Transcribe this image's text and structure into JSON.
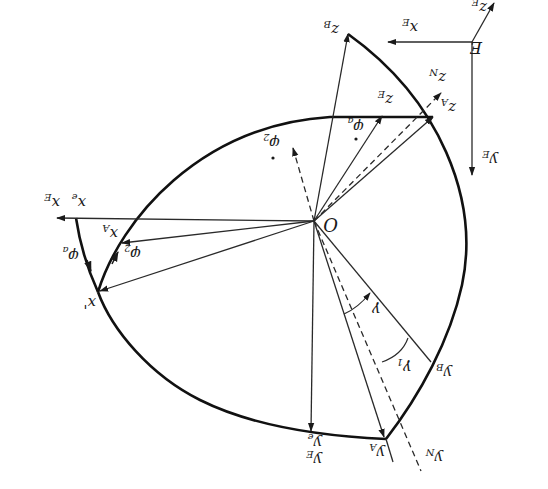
{
  "figure": {
    "orientation": "rotated 180 degrees (upside-down)"
  },
  "colors": {
    "background": "#ffffff",
    "ink": "#1a1a1a"
  },
  "labels": {
    "origin": "O",
    "frame_E": "E",
    "x_E_top": "x",
    "x_E_top_sub": "E",
    "y_E_top": "y",
    "y_E_top_sub": "E",
    "z_E_top": "z",
    "z_E_top_sub": "E",
    "z_B": "z",
    "z_B_sub": "B",
    "z_N": "z",
    "z_N_sub": "N",
    "z_A": "z",
    "z_A_sub": "A",
    "z_E": "z",
    "z_E_sub": "E",
    "phi_a_upper": "φ",
    "phi_a_upper_sub": "a",
    "phi_2_upper": "φ",
    "phi_2_upper_sub": "2",
    "x_E": "x",
    "x_E_sub": "E",
    "x_e": "x",
    "x_e_sub": "e",
    "x_A": "x",
    "x_A_sub": "A",
    "phi_2_lower": "φ",
    "phi_2_lower_sub": "2",
    "phi_a_lower": "φ",
    "phi_a_lower_sub": "a",
    "x_prime": "x'",
    "gamma": "γ",
    "gamma_1": "γ",
    "gamma_1_sub": "1",
    "y_B": "y",
    "y_B_sub": "B",
    "y_N": "y",
    "y_N_sub": "N",
    "y_A": "y",
    "y_A_sub": "A",
    "y_e": "y",
    "y_e_sub": "e",
    "y_E": "y",
    "y_E_sub": "E"
  },
  "points": {
    "O": [
      314,
      221
    ],
    "E_origin": [
      472,
      42
    ],
    "x_E_top_tip": [
      388,
      42
    ],
    "y_E_top_tip": [
      472,
      175
    ],
    "z_E_top_tip": [
      494,
      3
    ],
    "z_B_tip": [
      348,
      34
    ],
    "z_A_corner": [
      433,
      117
    ],
    "z_E_tip": [
      382,
      116
    ],
    "z_N_tip": [
      441,
      93
    ],
    "phi2_dashed_tip": [
      293,
      148
    ],
    "x_E_tip": [
      57,
      218
    ],
    "x_e_point": [
      76,
      218
    ],
    "x_A_tip": [
      120,
      243
    ],
    "x_prime_tip": [
      98,
      292
    ],
    "y_e_point": [
      311,
      431
    ],
    "y_A_corner": [
      386,
      439
    ],
    "y_B_point": [
      431,
      362
    ],
    "y_N_end": [
      421,
      471
    ]
  }
}
